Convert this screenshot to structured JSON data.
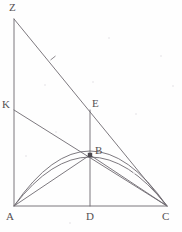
{
  "figure": {
    "width": 182,
    "height": 232,
    "background_color": "#fefefe",
    "stroke_color": "#6e6a70",
    "label_color": "#555052",
    "vertices": [
      {
        "id": "Z",
        "label": "Z",
        "x": 14,
        "y": 19,
        "label_x": 9,
        "label_y": 2
      },
      {
        "id": "K",
        "label": "K",
        "x": 14,
        "y": 110,
        "label_x": 2,
        "label_y": 99
      },
      {
        "id": "E",
        "label": "E",
        "x": 90,
        "y": 110,
        "label_x": 92,
        "label_y": 98
      },
      {
        "id": "B",
        "label": "B",
        "x": 90,
        "y": 155,
        "label_x": 95,
        "label_y": 145
      },
      {
        "id": "A",
        "label": "A",
        "x": 14,
        "y": 206,
        "label_x": 6,
        "label_y": 211
      },
      {
        "id": "D",
        "label": "D",
        "x": 90,
        "y": 206,
        "label_x": 86,
        "label_y": 211
      },
      {
        "id": "C",
        "label": "C",
        "x": 167,
        "y": 206,
        "label_x": 162,
        "label_y": 211
      }
    ],
    "segments": [
      {
        "name": "segment-AZ",
        "from": "A",
        "to": "Z",
        "style": "solid"
      },
      {
        "name": "segment-ZC",
        "from": "Z",
        "to": "C",
        "style": "solid"
      },
      {
        "name": "segment-AC",
        "from": "A",
        "to": "C",
        "style": "solid"
      },
      {
        "name": "segment-KC",
        "from": "K",
        "to": "C",
        "style": "solid"
      },
      {
        "name": "segment-ED",
        "from": "E",
        "to": "D",
        "style": "solid"
      },
      {
        "name": "segment-AB",
        "from": "A",
        "to": "B",
        "style": "solid"
      },
      {
        "name": "segment-BC",
        "from": "B",
        "to": "C",
        "style": "solid"
      }
    ],
    "curves": [
      {
        "name": "arc-ABC-upper",
        "from": "A",
        "apex": "B",
        "to": "C",
        "apex_offset": -4
      },
      {
        "name": "arc-ABC-lower",
        "from": "A",
        "apex": "B",
        "to": "C",
        "apex_offset": 2
      }
    ],
    "tick_marks": [
      {
        "name": "tick-on-ZC",
        "x": 53,
        "y": 58
      }
    ],
    "specks": [
      {
        "x": 44,
        "y": 84,
        "size": 2
      },
      {
        "x": 108,
        "y": 37,
        "size": 2
      },
      {
        "x": 92,
        "y": 81,
        "size": 2
      },
      {
        "x": 160,
        "y": 55,
        "size": 2
      },
      {
        "x": 135,
        "y": 113,
        "size": 2
      },
      {
        "x": 55,
        "y": 131,
        "size": 2
      },
      {
        "x": 133,
        "y": 172,
        "size": 2
      },
      {
        "x": 69,
        "y": 222,
        "size": 2
      },
      {
        "x": 172,
        "y": 85,
        "size": 2
      },
      {
        "x": 25,
        "y": 155,
        "size": 2
      }
    ]
  }
}
